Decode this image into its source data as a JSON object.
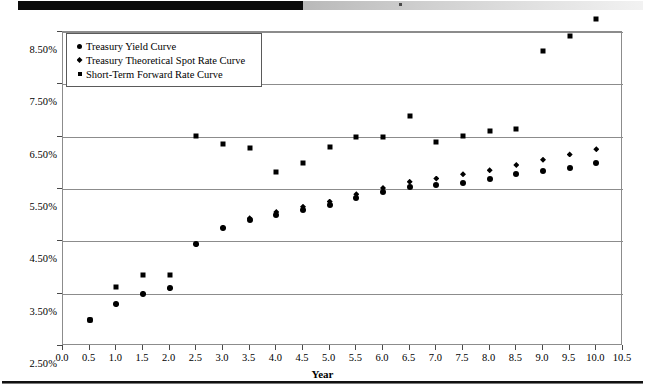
{
  "page": {
    "decor": {
      "top_black_bar": "black-bar",
      "top_gradient_bar": "gradient-bar",
      "bottom_rule": "horizontal-rule"
    }
  },
  "chart_data": {
    "type": "scatter",
    "title": "",
    "xlabel": "Year",
    "ylabel": "",
    "xlim": [
      0.0,
      10.5
    ],
    "ylim": [
      2.5,
      8.5
    ],
    "grid": true,
    "legend_position": "top-left",
    "x_ticks": [
      "0.0",
      "0.5",
      "1.0",
      "1.5",
      "2.0",
      "2.5",
      "3.0",
      "3.5",
      "4.0",
      "4.5",
      "5.0",
      "5.5",
      "6.0",
      "6.5",
      "7.0",
      "7.5",
      "8.0",
      "8.5",
      "9.0",
      "9.5",
      "10.0",
      "10.5"
    ],
    "x_tick_values": [
      0.0,
      0.5,
      1.0,
      1.5,
      2.0,
      2.5,
      3.0,
      3.5,
      4.0,
      4.5,
      5.0,
      5.5,
      6.0,
      6.5,
      7.0,
      7.5,
      8.0,
      8.5,
      9.0,
      9.5,
      10.0,
      10.5
    ],
    "y_ticks": [
      "2.50%",
      "3.50%",
      "4.50%",
      "5.50%",
      "6.50%",
      "7.50%",
      "8.50%"
    ],
    "y_tick_values": [
      2.5,
      3.5,
      4.5,
      5.5,
      6.5,
      7.5,
      8.5
    ],
    "x": [
      0.5,
      1.0,
      1.5,
      2.0,
      2.5,
      3.0,
      3.5,
      4.0,
      4.5,
      5.0,
      5.5,
      6.0,
      6.5,
      7.0,
      7.5,
      8.0,
      8.5,
      9.0,
      9.5,
      10.0
    ],
    "series": [
      {
        "name": "Treasury Yield Curve",
        "marker": "circle",
        "color": "#000000",
        "values": [
          3.0,
          3.3,
          3.5,
          3.6,
          4.44,
          4.76,
          4.9,
          5.0,
          5.1,
          5.2,
          5.32,
          5.44,
          5.54,
          5.58,
          5.62,
          5.7,
          5.78,
          5.84,
          5.9,
          6.0
        ]
      },
      {
        "name": "Treasury Theoretical Spot Rate Curve",
        "marker": "diamond",
        "color": "#000000",
        "values": [
          3.0,
          3.3,
          3.5,
          3.6,
          4.44,
          4.76,
          4.94,
          5.06,
          5.16,
          5.26,
          5.4,
          5.52,
          5.64,
          5.7,
          5.78,
          5.86,
          5.96,
          6.06,
          6.16,
          6.26
        ]
      },
      {
        "name": "Short-Term Forward Rate Curve",
        "marker": "square",
        "color": "#000000",
        "values": [
          3.0,
          3.62,
          3.86,
          3.86,
          6.52,
          6.36,
          6.28,
          5.82,
          6.0,
          6.3,
          6.5,
          6.5,
          6.9,
          6.4,
          6.52,
          6.6,
          6.64,
          8.14,
          8.42,
          8.74
        ]
      }
    ]
  }
}
